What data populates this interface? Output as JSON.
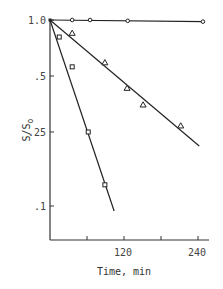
{
  "chart_data": {
    "type": "scatter",
    "title": "",
    "xlabel": "Time, min",
    "ylabel": "S/S0",
    "xscale": "linear",
    "yscale": "log",
    "xlim": [
      0,
      260
    ],
    "ylim": [
      0.07,
      1.0
    ],
    "x_ticks": [
      60,
      120,
      180,
      240
    ],
    "x_tick_labels": [
      "",
      "120",
      "",
      "240"
    ],
    "y_ticks": [
      1.0,
      0.5,
      0.25,
      0.1
    ],
    "y_tick_labels": [
      "1.0",
      ".5",
      ".25",
      ".1"
    ],
    "grid": false,
    "legend": null,
    "series": [
      {
        "name": "circles",
        "marker": "circle",
        "points": [
          [
            0,
            1.0
          ],
          [
            36,
            1.0
          ],
          [
            65,
            1.0
          ],
          [
            126,
            0.99
          ],
          [
            248,
            0.98
          ]
        ],
        "fit_line": [
          [
            0,
            1.0
          ],
          [
            250,
            0.98
          ]
        ]
      },
      {
        "name": "triangles",
        "marker": "triangle",
        "points": [
          [
            0,
            1.0
          ],
          [
            36,
            0.85
          ],
          [
            89,
            0.59
          ],
          [
            125,
            0.43
          ],
          [
            151,
            0.35
          ],
          [
            212,
            0.27
          ]
        ],
        "fit_line": [
          [
            0,
            1.0
          ],
          [
            242,
            0.21
          ]
        ]
      },
      {
        "name": "squares",
        "marker": "square",
        "points": [
          [
            0,
            1.0
          ],
          [
            15,
            0.81
          ],
          [
            36,
            0.56
          ],
          [
            62,
            0.25
          ],
          [
            89,
            0.13
          ]
        ],
        "fit_line": [
          [
            0,
            1.0
          ],
          [
            104,
            0.094
          ]
        ]
      }
    ]
  },
  "labels": {
    "xlabel": "Time, min",
    "ylabel_main": "S/S",
    "ylabel_sub": "o",
    "y1": "1.0",
    "y2": ".5",
    "y3": ".25",
    "y4": ".1",
    "x1": "120",
    "x2": "240"
  }
}
